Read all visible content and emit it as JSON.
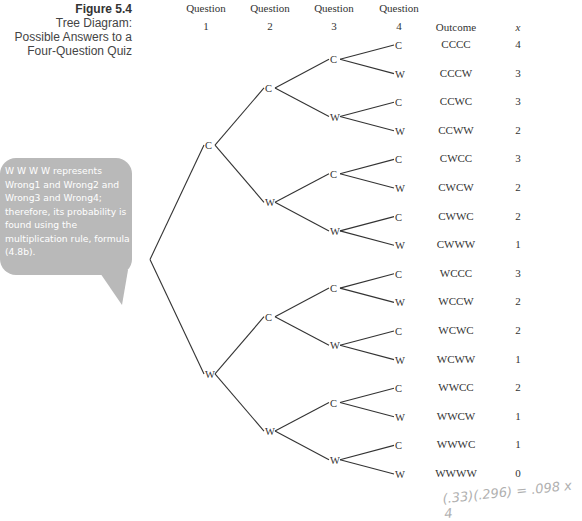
{
  "figure": {
    "number": "Figure 5.4",
    "caption_lines": [
      "Tree Diagram:",
      "Possible Answers to a",
      "Four-Question Quiz"
    ]
  },
  "headers": {
    "q1_top": "Question",
    "q1_num": "1",
    "q2_top": "Question",
    "q2_num": "2",
    "q3_top": "Question",
    "q3_num": "3",
    "q4_top": "Question",
    "q4_num": "4",
    "outcome": "Outcome",
    "x": "x"
  },
  "callout": {
    "text": "W W W W represents Wrong1 and Wrong2 and Wrong3 and Wrong4; therefore, its probability is found using the multiplication rule, formula (4.8b)."
  },
  "outcomes": [
    {
      "outcome": "CCCC",
      "x": "4"
    },
    {
      "outcome": "CCCW",
      "x": "3"
    },
    {
      "outcome": "CCWC",
      "x": "3"
    },
    {
      "outcome": "CCWW",
      "x": "2"
    },
    {
      "outcome": "CWCC",
      "x": "3"
    },
    {
      "outcome": "CWCW",
      "x": "2"
    },
    {
      "outcome": "CWWC",
      "x": "2"
    },
    {
      "outcome": "CWWW",
      "x": "1"
    },
    {
      "outcome": "WCCC",
      "x": "3"
    },
    {
      "outcome": "WCCW",
      "x": "2"
    },
    {
      "outcome": "WCWC",
      "x": "2"
    },
    {
      "outcome": "WCWW",
      "x": "1"
    },
    {
      "outcome": "WWCC",
      "x": "2"
    },
    {
      "outcome": "WWCW",
      "x": "1"
    },
    {
      "outcome": "WWWC",
      "x": "1"
    },
    {
      "outcome": "WWWW",
      "x": "0"
    }
  ],
  "tree_labels": {
    "correct": "C",
    "wrong": "W"
  },
  "handwriting": "(.33)(.296) = .098 x 4"
}
